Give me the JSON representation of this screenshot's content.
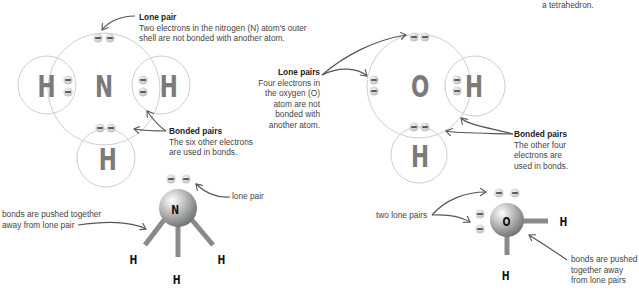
{
  "top_right_text": "a tetrahedron.",
  "ammonia": {
    "atoms": {
      "center": "N",
      "left": "H",
      "right": "H",
      "bottom": "H"
    },
    "lone_pair_label": {
      "title": "Lone pair",
      "lines": [
        "Two electrons in the nitrogen (N) atom's outer",
        "shell are not bonded with another atom."
      ]
    },
    "bonded_pairs_label": {
      "title": "Bonded pairs",
      "lines": [
        "The six other electrons",
        "are used in bonds."
      ]
    },
    "model": {
      "center": "N",
      "h_left": "H",
      "h_bottom": "H",
      "h_right": "H",
      "lone_pair_label": "lone pair",
      "bonds_label_lines": [
        "bonds are pushed together",
        "away from lone pair"
      ]
    }
  },
  "water": {
    "atoms": {
      "center": "O",
      "right": "H",
      "bottom": "H"
    },
    "lone_pairs_label": {
      "title": "Lone pairs",
      "lines": [
        "Four electrons in",
        "the oxygen (O)",
        "atom are not",
        "bonded with",
        "another atom."
      ]
    },
    "bonded_pairs_label": {
      "title": "Bonded pairs",
      "lines": [
        "The other four",
        "electrons are",
        "used in bonds."
      ]
    },
    "model": {
      "center": "O",
      "h_right": "H",
      "h_bottom": "H",
      "lone_pairs_label": "two lone pairs",
      "bonds_label_lines": [
        "bonds are pushed",
        "together away",
        "from lone pairs"
      ]
    }
  },
  "colors": {
    "shell_stroke": "#c8c8c8",
    "atom_letter": "#7a7a7a",
    "electron_fill": "#d4d4d4",
    "arrow": "#555555",
    "bond": "#8a8a8a"
  }
}
